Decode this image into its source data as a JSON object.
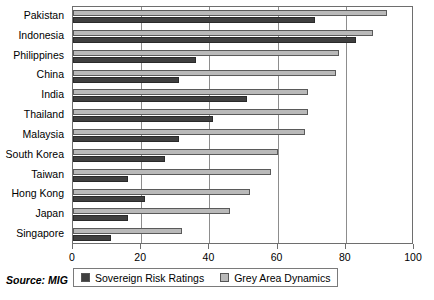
{
  "chart_data": {
    "type": "bar",
    "orientation": "horizontal",
    "title": "",
    "xlabel": "",
    "ylabel": "",
    "xlim": [
      0,
      100
    ],
    "xticks": [
      0,
      20,
      40,
      60,
      80,
      100
    ],
    "grid": true,
    "legend_position": "bottom",
    "categories": [
      "Pakistan",
      "Indonesia",
      "Philippines",
      "China",
      "India",
      "Thailand",
      "Malaysia",
      "South Korea",
      "Taiwan",
      "Hong Kong",
      "Japan",
      "Singapore"
    ],
    "series": [
      {
        "name": "Grey Area Dynamics",
        "color": "#b9b9b9",
        "values": [
          92,
          88,
          78,
          77,
          69,
          69,
          68,
          60,
          58,
          52,
          46,
          32
        ]
      },
      {
        "name": "Sovereign Risk Ratings",
        "color": "#3f3f3f",
        "values": [
          71,
          83,
          36,
          31,
          51,
          41,
          31,
          27,
          16,
          21,
          16,
          11
        ]
      }
    ]
  },
  "footer": {
    "source": "Source: MIG"
  },
  "legend": {
    "items": [
      {
        "label": "Sovereign Risk Ratings",
        "swatch": "dark"
      },
      {
        "label": "Grey Area Dynamics",
        "swatch": "grey"
      }
    ]
  }
}
